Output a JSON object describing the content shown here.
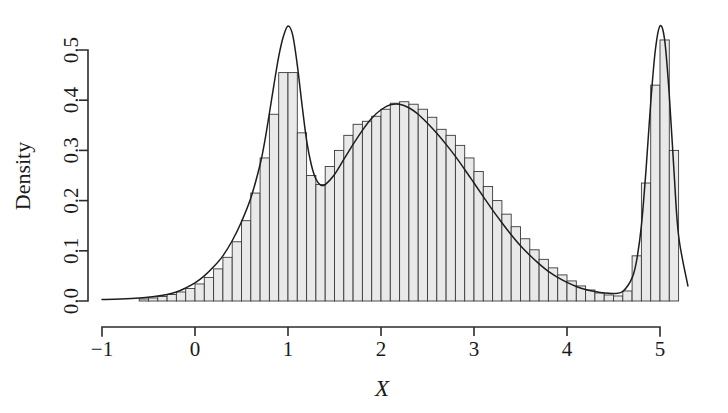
{
  "chart_data": {
    "type": "bar",
    "subtype": "histogram-with-density-overlay",
    "title": "",
    "subtitle": "",
    "xlabel": "X",
    "ylabel": "Density",
    "xlim": [
      -1.35,
      5.45
    ],
    "ylim": [
      0.0,
      0.565
    ],
    "x_ticks": [
      -1,
      0,
      1,
      2,
      3,
      4,
      5
    ],
    "x_tick_labels": [
      "−1",
      "0",
      "1",
      "2",
      "3",
      "4",
      "5"
    ],
    "y_ticks": [
      0.0,
      0.1,
      0.2,
      0.3,
      0.4,
      0.5
    ],
    "y_tick_labels": [
      "0.0",
      "0.1",
      "0.2",
      "0.3",
      "0.4",
      "0.5"
    ],
    "grid": false,
    "legend": null,
    "annotations": [],
    "bin_width": 0.1,
    "bin_starts": [
      -0.6,
      -0.5,
      -0.4,
      -0.3,
      -0.2,
      -0.1,
      0.0,
      0.1,
      0.2,
      0.3,
      0.4,
      0.5,
      0.6,
      0.7,
      0.8,
      0.9,
      1.0,
      1.1,
      1.2,
      1.3,
      1.4,
      1.5,
      1.6,
      1.7,
      1.8,
      1.9,
      2.0,
      2.1,
      2.2,
      2.3,
      2.4,
      2.5,
      2.6,
      2.7,
      2.8,
      2.9,
      3.0,
      3.1,
      3.2,
      3.3,
      3.4,
      3.5,
      3.6,
      3.7,
      3.8,
      3.9,
      4.0,
      4.1,
      4.2,
      4.3,
      4.4,
      4.5,
      4.6,
      4.7,
      4.8,
      4.9,
      5.0,
      5.1
    ],
    "values": [
      0.004,
      0.006,
      0.009,
      0.013,
      0.018,
      0.025,
      0.034,
      0.047,
      0.064,
      0.087,
      0.118,
      0.16,
      0.215,
      0.285,
      0.372,
      0.455,
      0.455,
      0.335,
      0.25,
      0.232,
      0.268,
      0.3,
      0.33,
      0.352,
      0.358,
      0.368,
      0.382,
      0.394,
      0.397,
      0.392,
      0.382,
      0.366,
      0.342,
      0.33,
      0.31,
      0.285,
      0.258,
      0.228,
      0.2,
      0.173,
      0.148,
      0.124,
      0.102,
      0.083,
      0.066,
      0.052,
      0.04,
      0.03,
      0.022,
      0.016,
      0.012,
      0.01,
      0.02,
      0.09,
      0.235,
      0.43,
      0.52,
      0.3
    ],
    "curve": {
      "name": "kernel density estimate",
      "x": [
        -1.0,
        -0.8,
        -0.6,
        -0.4,
        -0.3,
        -0.2,
        -0.1,
        0.0,
        0.1,
        0.2,
        0.3,
        0.4,
        0.5,
        0.6,
        0.7,
        0.75,
        0.8,
        0.85,
        0.9,
        0.95,
        1.0,
        1.05,
        1.1,
        1.15,
        1.2,
        1.25,
        1.3,
        1.35,
        1.4,
        1.5,
        1.6,
        1.7,
        1.8,
        1.9,
        2.0,
        2.1,
        2.2,
        2.3,
        2.4,
        2.5,
        2.6,
        2.7,
        2.8,
        2.9,
        3.0,
        3.1,
        3.2,
        3.3,
        3.4,
        3.5,
        3.6,
        3.7,
        3.8,
        3.9,
        4.0,
        4.1,
        4.2,
        4.3,
        4.4,
        4.5,
        4.6,
        4.7,
        4.75,
        4.8,
        4.85,
        4.9,
        4.95,
        5.0,
        5.05,
        5.1,
        5.15,
        5.2,
        5.3
      ],
      "y": [
        0.003,
        0.004,
        0.006,
        0.01,
        0.013,
        0.018,
        0.026,
        0.036,
        0.05,
        0.068,
        0.09,
        0.12,
        0.158,
        0.205,
        0.272,
        0.318,
        0.374,
        0.432,
        0.487,
        0.527,
        0.548,
        0.53,
        0.47,
        0.392,
        0.32,
        0.272,
        0.243,
        0.231,
        0.232,
        0.252,
        0.282,
        0.312,
        0.34,
        0.364,
        0.381,
        0.391,
        0.392,
        0.385,
        0.372,
        0.354,
        0.334,
        0.312,
        0.288,
        0.262,
        0.235,
        0.208,
        0.181,
        0.156,
        0.132,
        0.11,
        0.091,
        0.074,
        0.059,
        0.047,
        0.037,
        0.029,
        0.023,
        0.019,
        0.016,
        0.015,
        0.019,
        0.046,
        0.082,
        0.15,
        0.262,
        0.395,
        0.5,
        0.548,
        0.52,
        0.41,
        0.26,
        0.13,
        0.03
      ]
    }
  },
  "axes": {
    "y_axis_title": "Density",
    "x_axis_title": "X"
  }
}
